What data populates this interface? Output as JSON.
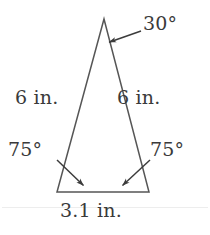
{
  "figure": {
    "kind": "geometry-diagram",
    "shape": "isosceles-triangle",
    "stroke_color": "#565656",
    "text_color": "#3a3a3a",
    "background_color": "#ffffff",
    "vertices": {
      "apex": [
        104,
        19
      ],
      "bottom_left": [
        57,
        192
      ],
      "bottom_right": [
        149,
        192
      ]
    },
    "labels": {
      "apex_angle": "30°",
      "left_side": "6 in.",
      "right_side": "6 in.",
      "left_base_angle": "75°",
      "right_base_angle": "75°",
      "base_length": "3.1 in."
    },
    "leaders": {
      "apex_arrow": {
        "from": [
          141,
          31
        ],
        "to": [
          107,
          43
        ]
      },
      "left_base_arrow": {
        "from": [
          57,
          160
        ],
        "to": [
          86,
          188
        ]
      },
      "right_base_arrow": {
        "from": [
          150,
          160
        ],
        "to": [
          120,
          188
        ]
      }
    }
  }
}
